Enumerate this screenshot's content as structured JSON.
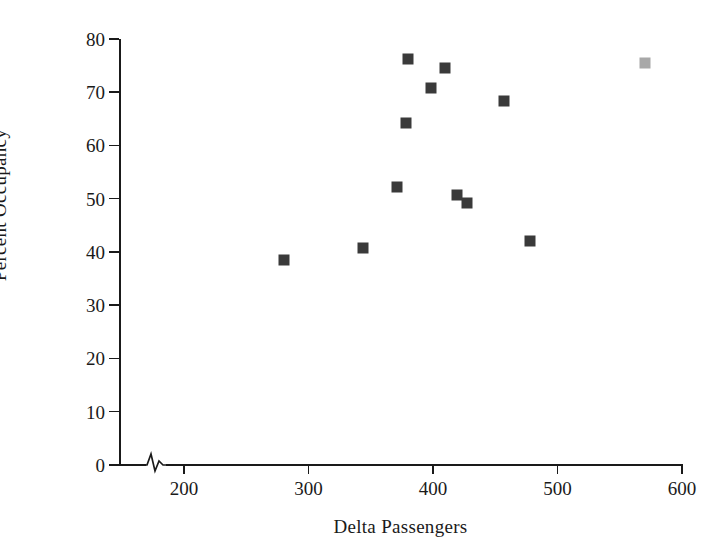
{
  "chart_data": {
    "type": "scatter",
    "title": "",
    "xlabel": "Delta Passengers",
    "ylabel": "Percent Occupancy",
    "xlim": [
      170,
      600
    ],
    "ylim": [
      0,
      80
    ],
    "x_ticks": [
      200,
      300,
      400,
      500,
      600
    ],
    "y_ticks": [
      0,
      10,
      20,
      30,
      40,
      50,
      60,
      70,
      80
    ],
    "x_tick_labels": [
      "200",
      "300",
      "400",
      "500",
      "600"
    ],
    "y_tick_labels": [
      "0",
      "10",
      "20",
      "30",
      "40",
      "50",
      "60",
      "70",
      "80"
    ],
    "grid": false,
    "legend": false,
    "axis_break": {
      "axis": "x",
      "position": 178,
      "symbol": "zigzag"
    },
    "series": [
      {
        "name": "Delta routes",
        "marker": "square",
        "color": "#3a3a3a",
        "points": [
          {
            "x": 280,
            "y": 38.5
          },
          {
            "x": 344,
            "y": 40.7
          },
          {
            "x": 371,
            "y": 52.1
          },
          {
            "x": 378,
            "y": 64.3
          },
          {
            "x": 380,
            "y": 76.3
          },
          {
            "x": 398,
            "y": 70.7
          },
          {
            "x": 410,
            "y": 74.5
          },
          {
            "x": 419,
            "y": 50.6
          },
          {
            "x": 427,
            "y": 49.1
          },
          {
            "x": 457,
            "y": 68.3
          },
          {
            "x": 478,
            "y": 42.1
          }
        ]
      },
      {
        "name": "Highlighted route",
        "marker": "square",
        "color": "#a8a8a8",
        "points": [
          {
            "x": 570,
            "y": 75.5
          }
        ]
      }
    ]
  },
  "axes": {
    "x_axis_label": "Delta Passengers",
    "y_axis_label": "Percent Occupancy"
  },
  "colors": {
    "marker_dark": "#3a3a3a",
    "marker_light": "#a8a8a8",
    "axis": "#1a1a1a",
    "background": "#ffffff"
  }
}
